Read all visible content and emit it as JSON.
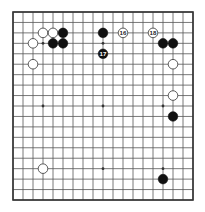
{
  "diagram": {
    "type": "go-board",
    "size": 19,
    "colors": {
      "background": "#ffffff",
      "line": "#555555",
      "border": "#333333",
      "black_stone": "#111111",
      "white_stone": "#ffffff",
      "white_stone_outline": "#333333"
    },
    "star_points": [
      [
        3,
        3
      ],
      [
        9,
        3
      ],
      [
        15,
        3
      ],
      [
        3,
        9
      ],
      [
        9,
        9
      ],
      [
        15,
        9
      ],
      [
        3,
        15
      ],
      [
        9,
        15
      ],
      [
        15,
        15
      ]
    ],
    "stones": [
      {
        "color": "white",
        "col": 3,
        "row": 2,
        "label": ""
      },
      {
        "color": "white",
        "col": 4,
        "row": 2,
        "label": ""
      },
      {
        "color": "black",
        "col": 5,
        "row": 2,
        "label": ""
      },
      {
        "color": "white",
        "col": 2,
        "row": 3,
        "label": ""
      },
      {
        "color": "black",
        "col": 4,
        "row": 3,
        "label": ""
      },
      {
        "color": "black",
        "col": 5,
        "row": 3,
        "label": ""
      },
      {
        "color": "white",
        "col": 2,
        "row": 5,
        "label": ""
      },
      {
        "color": "black",
        "col": 9,
        "row": 2,
        "label": ""
      },
      {
        "color": "white",
        "col": 11,
        "row": 2,
        "label": "16"
      },
      {
        "color": "black",
        "col": 9,
        "row": 4,
        "label": "17"
      },
      {
        "color": "white",
        "col": 14,
        "row": 2,
        "label": "18"
      },
      {
        "color": "black",
        "col": 15,
        "row": 3,
        "label": ""
      },
      {
        "color": "black",
        "col": 16,
        "row": 3,
        "label": ""
      },
      {
        "color": "white",
        "col": 16,
        "row": 5,
        "label": ""
      },
      {
        "color": "white",
        "col": 16,
        "row": 8,
        "label": ""
      },
      {
        "color": "black",
        "col": 16,
        "row": 10,
        "label": ""
      },
      {
        "color": "white",
        "col": 3,
        "row": 15,
        "label": ""
      },
      {
        "color": "black",
        "col": 15,
        "row": 16,
        "label": ""
      }
    ]
  }
}
